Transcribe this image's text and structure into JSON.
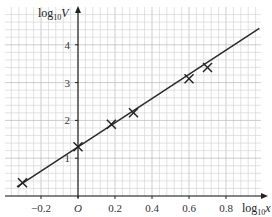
{
  "chart_data": {
    "type": "scatter",
    "title": "",
    "xlabel": "log10 x",
    "ylabel": "log10 V",
    "xlabel_parts": {
      "base": "log",
      "sub": "10",
      "var": "x"
    },
    "ylabel_parts": {
      "base": "log",
      "sub": "10",
      "var": "V"
    },
    "xlim": [
      -0.4,
      0.99
    ],
    "ylim": [
      0,
      5
    ],
    "x_ticks": [
      -0.2,
      0,
      0.2,
      0.4,
      0.6,
      0.8
    ],
    "x_tick_labels": [
      "−0.2",
      "O",
      "0.2",
      "0.4",
      "0.6",
      "0.8"
    ],
    "y_ticks": [
      1,
      2,
      3,
      4
    ],
    "y_tick_labels": [
      "1",
      "2",
      "3",
      "4"
    ],
    "grid": true,
    "points": [
      {
        "x": -0.3,
        "y": 0.35
      },
      {
        "x": 0.0,
        "y": 1.3
      },
      {
        "x": 0.18,
        "y": 1.9
      },
      {
        "x": 0.3,
        "y": 2.2
      },
      {
        "x": 0.6,
        "y": 3.1
      },
      {
        "x": 0.7,
        "y": 3.4
      }
    ],
    "marker": "x",
    "best_fit_line": {
      "slope": 3.2,
      "intercept": 1.3,
      "x_start": -0.33,
      "x_end": 0.98
    },
    "colors": {
      "grid_minor": "#d6d6d6",
      "grid_major": "#b8b8b8",
      "axis": "#222222",
      "line": "#2a2a2a",
      "marker": "#222222"
    }
  }
}
